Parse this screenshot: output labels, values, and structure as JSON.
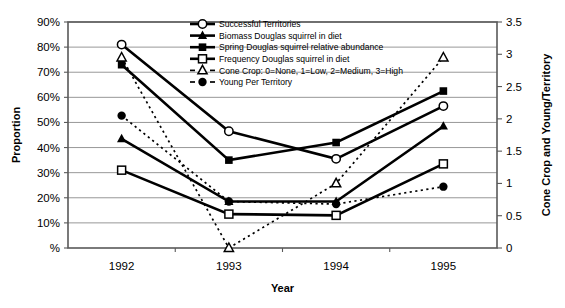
{
  "chart_data": {
    "type": "line",
    "title": "",
    "xlabel": "Year",
    "ylabel": "Proportion",
    "y2label": "Cone Crop and Young/Territory",
    "categories": [
      "1992",
      "1993",
      "1994",
      "1995"
    ],
    "x": [
      1992,
      1993,
      1994,
      1995
    ],
    "ylim": [
      0,
      90
    ],
    "y2lim": [
      0,
      3.5
    ],
    "yticks": [
      "%",
      "10%",
      "20%",
      "30%",
      "40%",
      "50%",
      "60%",
      "70%",
      "80%",
      "90%"
    ],
    "ytick_values": [
      0,
      10,
      20,
      30,
      40,
      50,
      60,
      70,
      80,
      90
    ],
    "y2ticks": [
      "0",
      "0.5",
      "1",
      "1.5",
      "2",
      "2.5",
      "3",
      "3.5"
    ],
    "y2tick_values": [
      0,
      0.5,
      1,
      1.5,
      2,
      2.5,
      3,
      3.5
    ],
    "grid": true,
    "legend_position": "top-center",
    "series": [
      {
        "name": "Successful Territories",
        "axis": "left",
        "marker": "open-circle",
        "line": "solid",
        "values": [
          81,
          46.5,
          35.5,
          56.5
        ]
      },
      {
        "name": "Biomass Douglas squirrel in diet",
        "axis": "left",
        "marker": "filled-triangle",
        "line": "solid",
        "values": [
          43.5,
          18.5,
          18.5,
          48.5
        ]
      },
      {
        "name": "Spring Douglas squirrel relative abundance",
        "axis": "left",
        "marker": "filled-square",
        "line": "solid",
        "values": [
          73,
          35,
          42,
          62.5
        ]
      },
      {
        "name": "Frequency Douglas squirrel in diet",
        "axis": "left",
        "marker": "open-square",
        "line": "solid",
        "values": [
          31,
          13.5,
          13,
          33.5
        ]
      },
      {
        "name": "Cone Crop: 0=None, 1=Low, 2=Medium, 3=High",
        "axis": "right",
        "marker": "open-triangle",
        "line": "dashed",
        "values": [
          2.95,
          0,
          1.0,
          2.95
        ]
      },
      {
        "name": "Young Per Territory",
        "axis": "right",
        "marker": "filled-circle",
        "line": "dashed",
        "values": [
          2.05,
          0.72,
          0.68,
          0.95
        ]
      }
    ]
  },
  "colors": {
    "series": "#000000",
    "grid": "#8c8c8c",
    "axis": "#595959",
    "background": "#ffffff"
  }
}
